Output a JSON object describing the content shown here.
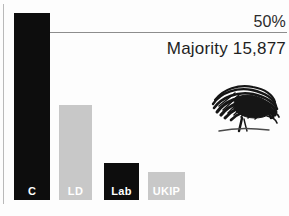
{
  "chart_data": {
    "type": "bar",
    "title": "",
    "categories": [
      "C",
      "LD",
      "Lab",
      "UKIP"
    ],
    "values": [
      100,
      50.5,
      19.7,
      14.9
    ],
    "series": [
      {
        "name": "Vote share",
        "values": [
          100,
          50.5,
          19.7,
          14.9
        ]
      }
    ],
    "bar_colors": [
      "#0d0d0d",
      "#c8c8c8",
      "#0d0d0d",
      "#c8c8c8"
    ],
    "xlabel": "",
    "ylabel": "",
    "ylim": [
      0,
      100
    ],
    "grid": false,
    "legend": "none",
    "annotations": [
      {
        "name": "threshold",
        "label": "50%",
        "value": 50
      },
      {
        "name": "majority",
        "label": "Majority 15,877"
      }
    ]
  },
  "chart": {
    "threshold_label": "50%",
    "majority_label": "Majority 15,877",
    "bars": [
      {
        "label": "C",
        "tone": "dark",
        "color": "#0d0d0d",
        "left": 14,
        "width": 36,
        "top": 13
      },
      {
        "label": "LD",
        "tone": "light",
        "color": "#c8c8c8",
        "left": 59,
        "width": 33,
        "top": 105
      },
      {
        "label": "Lab",
        "tone": "dark",
        "color": "#0d0d0d",
        "left": 104,
        "width": 35,
        "top": 163
      },
      {
        "label": "UKIP",
        "tone": "light",
        "color": "#c8c8c8",
        "left": 148,
        "width": 37,
        "top": 172
      }
    ],
    "logo_name": "conservative-oak-tree-logo",
    "colors": {
      "dark": "#0d0d0d",
      "light": "#c8c8c8",
      "rule": "#8d8d8d",
      "background": "#fdfdfd"
    }
  }
}
